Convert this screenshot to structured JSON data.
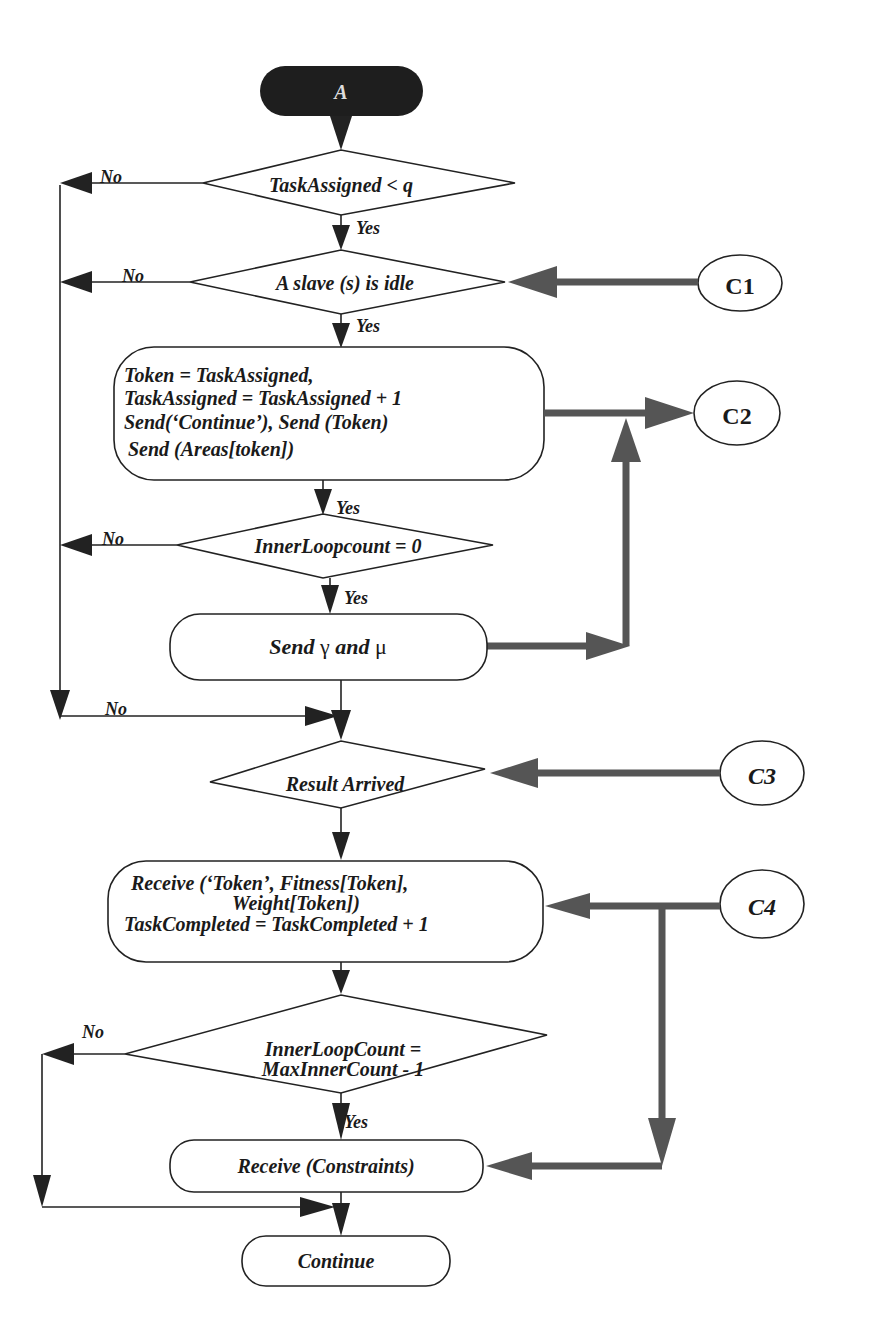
{
  "diagram": {
    "type": "flowchart",
    "start": {
      "label": "A"
    },
    "decisions": {
      "task_assigned": {
        "label": "TaskAssigned < q",
        "yes": "Yes",
        "no": "No"
      },
      "slave_idle": {
        "label": "A slave (s) is idle",
        "yes": "Yes",
        "no": "No"
      },
      "inner_loop_zero": {
        "label": "InnerLoopcount = 0",
        "yes": "Yes",
        "no": "No"
      },
      "result_arrived": {
        "label": "Result Arrived",
        "no": "No"
      },
      "inner_loop_max": {
        "line1": "InnerLoopCount =",
        "line2": "MaxInnerCount - 1",
        "yes": "Yes",
        "no": "No"
      }
    },
    "processes": {
      "assign": {
        "line1": "Token = TaskAssigned,",
        "line2": "TaskAssigned = TaskAssigned + 1",
        "line3": "Send(‘Continue’), Send (Token)",
        "line4": "Send (Areas[token])"
      },
      "send_params": {
        "label_pre": "Send ",
        "gamma": "γ",
        "label_mid": " and ",
        "mu": "μ"
      },
      "receive_result": {
        "line1": "Receive (‘Token’, Fitness[Token],",
        "line2": "Weight[Token])",
        "line3": "TaskCompleted = TaskCompleted + 1"
      },
      "receive_constraints": {
        "label": "Receive (Constraints)"
      },
      "continue": {
        "label": "Continue"
      }
    },
    "connectors": {
      "c1": "C1",
      "c2": "C2",
      "c3": "C3",
      "c4": "C4"
    }
  }
}
